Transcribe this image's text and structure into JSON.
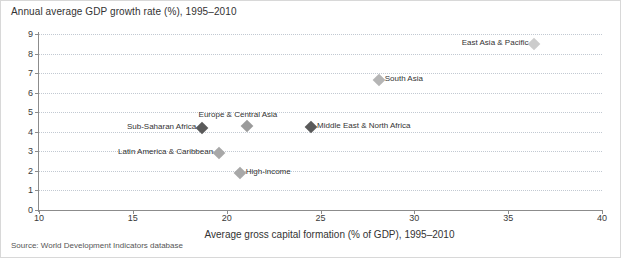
{
  "chart_data": {
    "type": "scatter",
    "title": "Annual average GDP growth rate (%), 1995–2010",
    "xlabel": "Average gross capital formation (% of GDP), 1995–2010",
    "ylabel": "Annual average GDP growth rate (%), 1995–2010",
    "xlim": [
      10,
      40
    ],
    "ylim": [
      0,
      9
    ],
    "xticks": [
      10,
      15,
      20,
      25,
      30,
      35,
      40
    ],
    "yticks": [
      0,
      1,
      2,
      3,
      4,
      5,
      6,
      7,
      8,
      9
    ],
    "grid": "horizontal-dotted",
    "legend": "none",
    "source": "Source: World Development Indicators database",
    "marker_shape": "diamond",
    "points": [
      {
        "label": "Sub-Saharan Africa",
        "x": 18.7,
        "y": 4.2,
        "color": "#5a5a5a",
        "label_side": "left"
      },
      {
        "label": "Europe & Central Asia",
        "x": 21.1,
        "y": 4.3,
        "color": "#9a9a9a",
        "label_side": "center-above"
      },
      {
        "label": "Latin America & Caribbean",
        "x": 19.6,
        "y": 2.9,
        "color": "#a8a8a8",
        "label_side": "left"
      },
      {
        "label": "High-income",
        "x": 20.7,
        "y": 1.9,
        "color": "#a8a8a8",
        "label_side": "right"
      },
      {
        "label": "Middle East & North Africa",
        "x": 24.5,
        "y": 4.25,
        "color": "#5a5a5a",
        "label_side": "right"
      },
      {
        "label": "South Asia",
        "x": 28.1,
        "y": 6.65,
        "color": "#b5b5b5",
        "label_side": "right"
      },
      {
        "label": "East Asia & Pacific",
        "x": 36.4,
        "y": 8.5,
        "color": "#cccccc",
        "label_side": "left"
      }
    ]
  },
  "colors": {
    "axis": "#8c8c8c",
    "grid": "#c2c9d2",
    "text": "#333333",
    "border": "#d8d8d8",
    "background": "#ffffff"
  }
}
